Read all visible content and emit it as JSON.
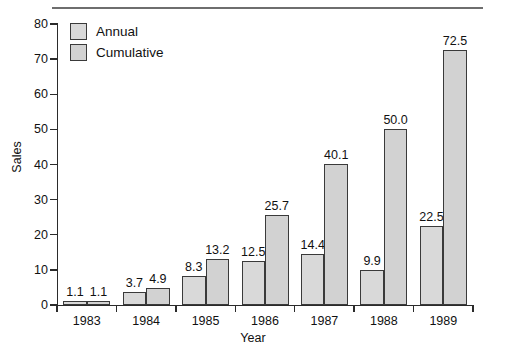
{
  "chart_data": {
    "type": "bar",
    "title": "",
    "xlabel": "Year",
    "ylabel": "Sales",
    "categories": [
      "1983",
      "1984",
      "1985",
      "1986",
      "1987",
      "1988",
      "1989"
    ],
    "series": [
      {
        "name": "Annual",
        "values": [
          1.1,
          3.7,
          8.3,
          12.5,
          14.4,
          9.9,
          22.5
        ],
        "labels": [
          "1.1",
          "3.7",
          "8.3",
          "12.5",
          "14.4",
          "9.9",
          "22.5"
        ],
        "color": "#d9d9d9"
      },
      {
        "name": "Cumulative",
        "values": [
          1.1,
          4.9,
          13.2,
          25.7,
          40.1,
          50.0,
          72.5
        ],
        "labels": [
          "1.1",
          "4.9",
          "13.2",
          "25.7",
          "40.1",
          "50.0",
          "72.5"
        ],
        "color": "#d2d2d2"
      }
    ],
    "ylim": [
      0,
      80
    ],
    "yticks": [
      0,
      10,
      20,
      30,
      40,
      50,
      60,
      70,
      80
    ],
    "ytick_labels": [
      "0",
      "10",
      "20",
      "30",
      "40",
      "50",
      "60",
      "70",
      "80"
    ],
    "grid": false,
    "legend_position": "top-left",
    "bar_border_color": "#3a3a3a",
    "axis_color": "#2b2b2b"
  },
  "legend": {
    "entries": [
      {
        "label": "Annual"
      },
      {
        "label": "Cumulative"
      }
    ]
  },
  "axes": {
    "y_title": "Sales",
    "x_title": "Year"
  },
  "decor": {
    "top_rule_color": "#6e6e6e"
  }
}
